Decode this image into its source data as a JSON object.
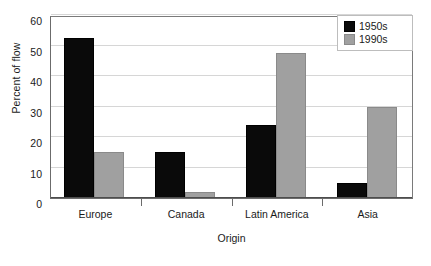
{
  "chart_data": {
    "type": "bar",
    "title": "",
    "xlabel": "Origin",
    "ylabel": "Percent of flow",
    "categories": [
      "Europe",
      "Canada",
      "Latin America",
      "Asia"
    ],
    "series": [
      {
        "name": "1950s",
        "color": "#0a0a0a",
        "values": [
          52.5,
          15,
          24,
          5
        ]
      },
      {
        "name": "1990s",
        "color": "#a0a0a0",
        "values": [
          15,
          2,
          47.5,
          30
        ]
      }
    ],
    "ylim": [
      0,
      60
    ],
    "yticks": [
      0,
      10,
      20,
      30,
      40,
      50,
      60
    ],
    "ytick_labels": [
      "0",
      "10",
      "20",
      "30",
      "40",
      "50",
      "60"
    ],
    "grid": true,
    "legend_position": "top-right",
    "legend_entries": [
      "1950s",
      "1990s"
    ]
  }
}
